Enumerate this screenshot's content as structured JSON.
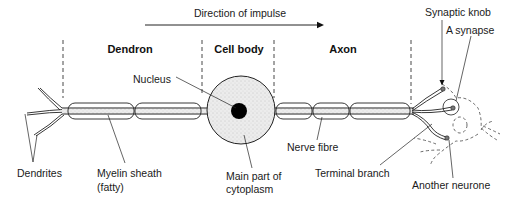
{
  "diagram": {
    "direction_label": "Direction of impulse",
    "regions": {
      "dendron": "Dendron",
      "cell_body": "Cell body",
      "axon": "Axon"
    },
    "labels": {
      "nucleus": "Nucleus",
      "dendrites": "Dendrites",
      "myelin_line1": "Myelin sheath",
      "myelin_line2": "(fatty)",
      "cytoplasm_line1": "Main part of",
      "cytoplasm_line2": "cytoplasm",
      "nerve_fibre": "Nerve fibre",
      "terminal_branch": "Terminal branch",
      "another_neurone": "Another neurone",
      "synaptic_knob": "Synaptic knob",
      "a_synapse": "A synapse"
    },
    "colors": {
      "ink": "#222222",
      "cell_fill": "#ebebeb",
      "nucleus": "#000000",
      "background": "#ffffff"
    }
  }
}
